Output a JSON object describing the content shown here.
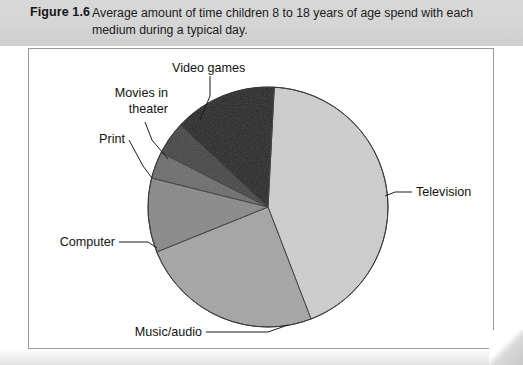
{
  "figure": {
    "label": "Figure 1.6",
    "caption": "Average amount of time children 8 to 18 years of age spend with each medium during a typical day."
  },
  "chart_data": {
    "type": "pie",
    "title": "Average amount of time children 8 to 18 years of age spend with each medium during a typical day.",
    "legend_position": "callout-labels",
    "grid": false,
    "categories": [
      "Television",
      "Music/audio",
      "Computer",
      "Print",
      "Movies in theater",
      "Video games"
    ],
    "values": [
      43.3,
      24.7,
      10.0,
      3.6,
      4.4,
      14.0
    ],
    "unit": "percent",
    "colors": [
      "#cdcdcd",
      "#a5a5a5",
      "#8a8a8a",
      "#6f6f6f",
      "#474747",
      "#262626"
    ],
    "start_angle_deg": 3,
    "slices": [
      {
        "name": "Television",
        "value": 43.3,
        "start_deg": 3,
        "end_deg": 159,
        "color": "#cdcdcd"
      },
      {
        "name": "Music/audio",
        "value": 24.7,
        "start_deg": 159,
        "end_deg": 248,
        "color": "#a5a5a5"
      },
      {
        "name": "Computer",
        "value": 10.0,
        "start_deg": 248,
        "end_deg": 284,
        "color": "#8a8a8a"
      },
      {
        "name": "Print",
        "value": 3.6,
        "start_deg": 284,
        "end_deg": 297,
        "color": "#6f6f6f"
      },
      {
        "name": "Movies in theater",
        "value": 4.4,
        "start_deg": 297,
        "end_deg": 313,
        "color": "#474747"
      },
      {
        "name": "Video games",
        "value": 14.0,
        "start_deg": 313,
        "end_deg": 363,
        "color": "#262626"
      }
    ]
  },
  "labels": {
    "television": "Television",
    "music_audio": "Music/audio",
    "computer": "Computer",
    "print": "Print",
    "movies_line1": "Movies in",
    "movies_line2": "theater",
    "video_games": "Video games"
  }
}
